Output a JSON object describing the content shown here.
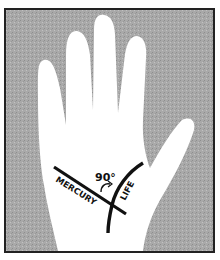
{
  "illustration": {
    "subject": "palm-of-hand",
    "labels": {
      "angle": "90°",
      "line_1": "MERCURY",
      "line_2": "LIFE"
    },
    "colors": {
      "background": "#a8a8a8",
      "hand": "#ffffff",
      "lines": "#111111",
      "border": "#222222"
    }
  }
}
